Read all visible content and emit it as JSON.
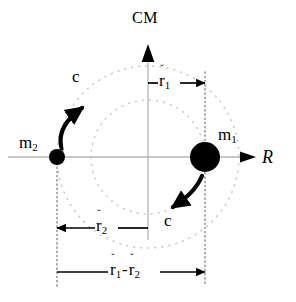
{
  "figure": {
    "title_label": "CM",
    "axis_horizontal_label": "R",
    "mass_right": {
      "symbol": "m",
      "subscript": "1"
    },
    "mass_left": {
      "symbol": "m",
      "subscript": "2"
    },
    "speed_label_upper": "c",
    "speed_label_lower": "c",
    "vector_r1": {
      "symbol": "r",
      "accent": "ˇ",
      "subscript": "1"
    },
    "vector_r2": {
      "symbol": "r",
      "accent": "ˇ",
      "subscript": "2"
    },
    "difference_operator": "-",
    "colors": {
      "ink": "#000000",
      "axis_gray": "#b0b0b0",
      "orbit_dotted": "#c9c9c9",
      "guide_dotted": "#8a8a8a",
      "background": "#ffffff"
    },
    "geometry": {
      "origin_x": 148,
      "origin_y": 157,
      "mass1_x": 205,
      "mass1_radius": 15,
      "mass2_x": 57,
      "mass2_radius": 8,
      "orbit_outer_radius": 91,
      "orbit_inner_radius": 57
    },
    "measurements": [
      {
        "name": "r1",
        "from_x": 148,
        "to_x": 205,
        "y": 83,
        "direction": "right"
      },
      {
        "name": "r2",
        "from_x": 148,
        "to_x": 57,
        "y": 228,
        "direction": "left"
      },
      {
        "name": "r1-minus-r2",
        "from_x": 57,
        "to_x": 205,
        "y": 272,
        "direction": "right"
      }
    ]
  }
}
